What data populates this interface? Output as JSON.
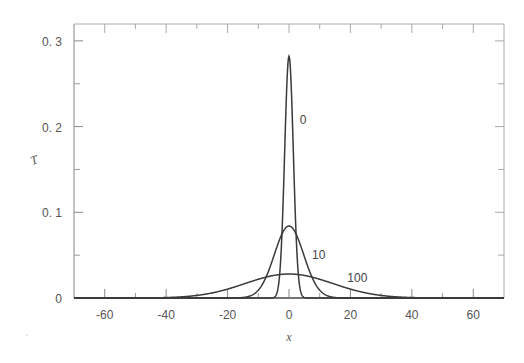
{
  "chart_data": {
    "type": "line",
    "title": "",
    "xlabel": "x",
    "ylabel": "T",
    "xlim": [
      -70,
      70
    ],
    "ylim": [
      0,
      0.31
    ],
    "x_ticks": [
      -60,
      -40,
      -20,
      0,
      20,
      40,
      60
    ],
    "x_tick_labels": [
      "-60",
      "-40",
      "-20",
      "0",
      "20",
      "40",
      "60"
    ],
    "x_minor_ticks": [
      -50,
      -30,
      -10,
      10,
      30,
      50
    ],
    "y_ticks": [
      0,
      0.1,
      0.2,
      0.3
    ],
    "y_tick_labels": [
      "0",
      "0.1",
      "0.2",
      "0.3"
    ],
    "y_minor_ticks": [
      0.05,
      0.15,
      0.25
    ],
    "grid": false,
    "legend": "none (inline curve labels)",
    "series": [
      {
        "name": "0",
        "shape": "gaussian",
        "center": 0,
        "peak": 0.282,
        "sigma": 1.41,
        "label_pos": {
          "x": 3.5,
          "y": 0.203
        },
        "x": [
          -10,
          -6,
          -4,
          -3,
          -2,
          -1,
          0,
          1,
          2,
          3,
          4,
          6,
          10
        ],
        "values": [
          0,
          0,
          0.0005,
          0.029,
          0.103,
          0.22,
          0.282,
          0.22,
          0.103,
          0.029,
          0.0005,
          0,
          0
        ]
      },
      {
        "name": "10",
        "shape": "gaussian",
        "center": 0,
        "peak": 0.084,
        "sigma": 4.75,
        "label_pos": {
          "x": 7.5,
          "y": 0.045
        },
        "x": [
          -20,
          -15,
          -10,
          -5,
          0,
          5,
          10,
          15,
          20
        ],
        "values": [
          0.0001,
          0.0058,
          0.0092,
          0.048,
          0.084,
          0.048,
          0.0092,
          0.0058,
          0.0001
        ]
      },
      {
        "name": "100",
        "shape": "gaussian",
        "center": 0,
        "peak": 0.028,
        "sigma": 14.2,
        "label_pos": {
          "x": 19.0,
          "y": 0.019
        },
        "x": [
          -50,
          -40,
          -30,
          -20,
          -10,
          0,
          10,
          20,
          30,
          40,
          50
        ],
        "values": [
          0.0001,
          0.0005,
          0.003,
          0.0104,
          0.0218,
          0.028,
          0.0218,
          0.0104,
          0.003,
          0.0005,
          0.0001
        ]
      }
    ]
  },
  "colors": {
    "curve": "#3a3a3a",
    "axis": "#555555",
    "frame": "#aaaaaa"
  }
}
